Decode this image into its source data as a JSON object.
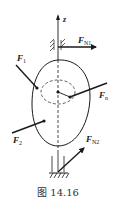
{
  "figure": {
    "caption": "图 14.16",
    "axis": {
      "label": "z"
    },
    "forces": {
      "f1": {
        "main": "F",
        "sub": "1"
      },
      "f2": {
        "main": "F",
        "sub": "2"
      },
      "fn": {
        "main": "F",
        "sub": "n"
      },
      "fn1": {
        "main": "F",
        "sub": "N1"
      },
      "fn2": {
        "main": "F",
        "sub": "N2"
      }
    },
    "colors": {
      "ink": "#1a1a1a",
      "caption": "#333333"
    }
  }
}
